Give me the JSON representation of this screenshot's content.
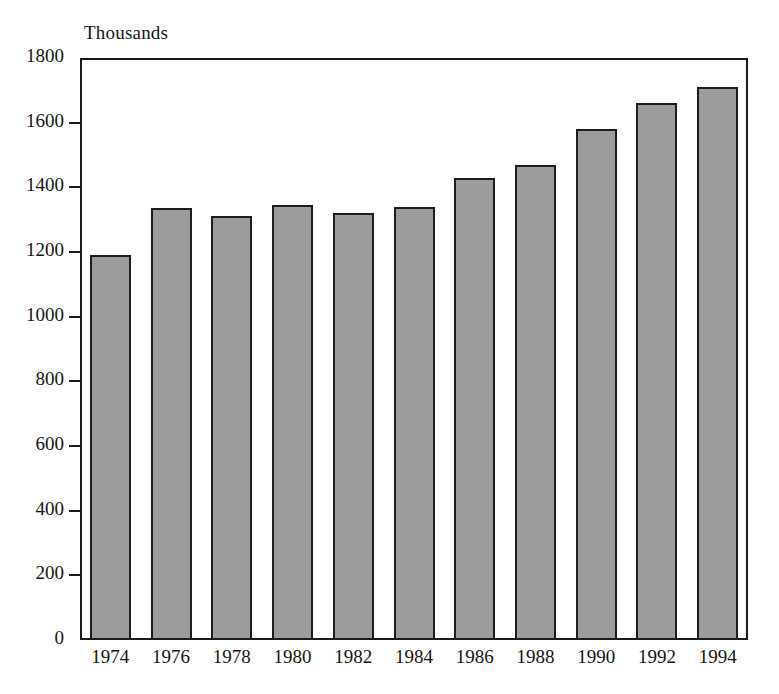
{
  "chart_data": {
    "type": "bar",
    "title": "",
    "subtitle": "",
    "unit_label": "Thousands",
    "xlabel": "",
    "ylabel": "Thousands",
    "categories": [
      "1974",
      "1976",
      "1978",
      "1980",
      "1982",
      "1984",
      "1986",
      "1988",
      "1990",
      "1992",
      "1994"
    ],
    "values": [
      1190,
      1335,
      1310,
      1345,
      1320,
      1340,
      1430,
      1470,
      1580,
      1660,
      1710
    ],
    "series": [
      {
        "name": "Total",
        "values": [
          1190,
          1335,
          1310,
          1345,
          1320,
          1340,
          1430,
          1470,
          1580,
          1660,
          1710
        ]
      }
    ],
    "ylim": [
      0,
      1800
    ],
    "ytick_values": [
      0,
      200,
      400,
      600,
      800,
      1000,
      1200,
      1400,
      1600,
      1800
    ],
    "yticks": [
      "0",
      "200",
      "400",
      "600",
      "800",
      "1000",
      "1200",
      "1400",
      "1600",
      "1800"
    ],
    "xticks": [
      "1974",
      "1976",
      "1978",
      "1980",
      "1982",
      "1984",
      "1986",
      "1988",
      "1990",
      "1992",
      "1994"
    ],
    "grid": false,
    "legend": null,
    "legend_position": "none",
    "annotations": [],
    "colors": {
      "bar_fill": "#9c9c9c",
      "bar_border": "#1d1d1d",
      "axis": "#1a1a1a",
      "text": "#141414",
      "background": "#ffffff"
    }
  }
}
